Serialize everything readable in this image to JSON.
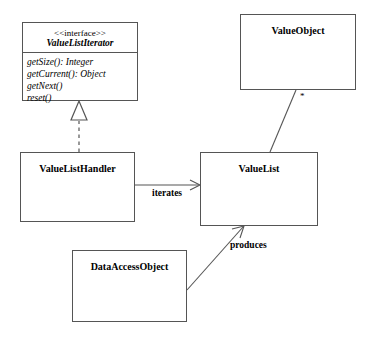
{
  "diagram": {
    "line_color": "#555555",
    "text_color": "#000000",
    "background": "#ffffff",
    "classes": [
      {
        "id": "value-list-iterator",
        "stereotype": "<<interface>>",
        "name": "ValueListIterator",
        "members": [
          "getSize(): Integer",
          "getCurrent(): Object",
          "getNext()",
          "reset()"
        ]
      },
      {
        "id": "value-object",
        "name": "ValueObject",
        "members": []
      },
      {
        "id": "value-list-handler",
        "name": "ValueListHandler",
        "members": []
      },
      {
        "id": "value-list",
        "name": "ValueList",
        "members": []
      },
      {
        "id": "data-access-object",
        "name": "DataAccessObject",
        "members": []
      }
    ],
    "relationships": [
      {
        "id": "realization",
        "type": "realization",
        "from": "ValueListHandler",
        "to": "ValueListIterator",
        "label": "",
        "line_style": "dashed",
        "arrow": "hollow-triangle"
      },
      {
        "id": "iterates",
        "type": "association",
        "from": "ValueListHandler",
        "to": "ValueList",
        "label": "iterates",
        "line_style": "solid",
        "arrow": "open"
      },
      {
        "id": "produces",
        "type": "association",
        "from": "DataAccessObject",
        "to": "ValueList",
        "label": "produces",
        "line_style": "solid",
        "arrow": "open"
      },
      {
        "id": "contains",
        "type": "association",
        "from": "ValueList",
        "to": "ValueObject",
        "label": "",
        "multiplicity": "*",
        "line_style": "solid",
        "arrow": "none"
      }
    ]
  }
}
